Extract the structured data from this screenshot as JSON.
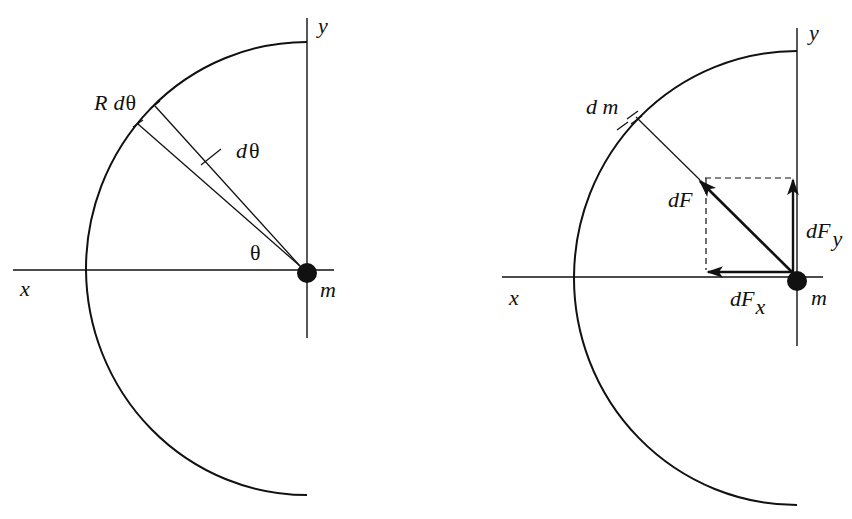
{
  "figure": {
    "left_panel": {
      "labels": {
        "y_axis": "y",
        "x_axis": "x",
        "arc_length": "R dθ",
        "arc_length_R": "R",
        "arc_length_d": "d",
        "arc_length_theta": "θ",
        "d_theta": "d",
        "d_theta_symbol": "θ",
        "theta": "θ",
        "mass": "m"
      }
    },
    "right_panel": {
      "labels": {
        "y_axis": "y",
        "x_axis": "x",
        "mass_element": "d m",
        "force": "dF",
        "force_y": "dF",
        "force_y_sub": "y",
        "force_x": "dF",
        "force_x_sub": "x",
        "mass": "m"
      }
    },
    "colors": {
      "stroke": "#111111",
      "background": "#ffffff"
    }
  }
}
